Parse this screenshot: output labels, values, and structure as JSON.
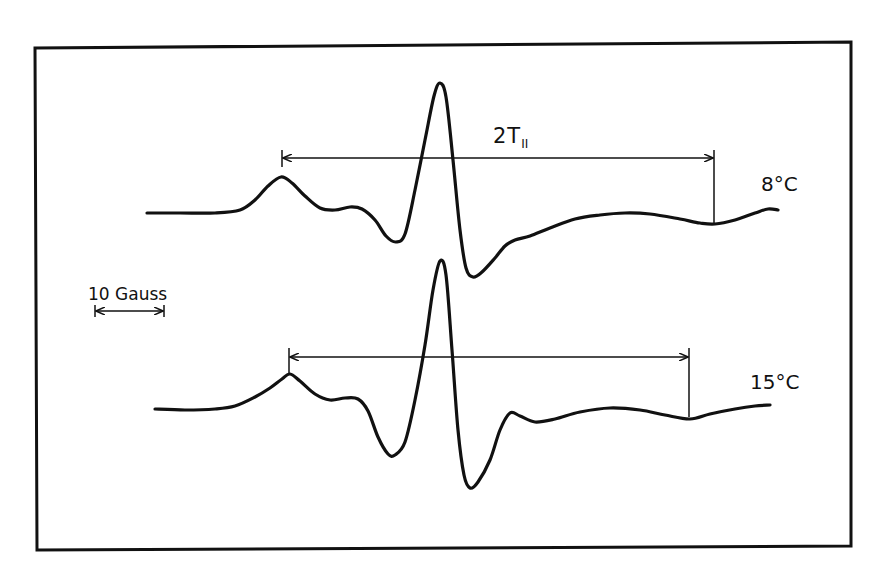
{
  "figure": {
    "type": "EPR spectra comparison",
    "frame_color": "#111111",
    "trace_color": "#111111",
    "background": "#ffffff"
  },
  "labels": {
    "splitting_main": "2T",
    "splitting_sub": "II",
    "trace_top_temp": "8°C",
    "trace_bottom_temp": "15°C",
    "scale_bar": "10 Gauss"
  },
  "spectra": [
    {
      "name": "8°C",
      "bracket": {
        "x_start": 282,
        "x_end": 714,
        "y": 158,
        "label": "2T||"
      },
      "points": [
        [
          147,
          213
        ],
        [
          180,
          213
        ],
        [
          215,
          213
        ],
        [
          240,
          210
        ],
        [
          255,
          200
        ],
        [
          268,
          186
        ],
        [
          281,
          177
        ],
        [
          292,
          183
        ],
        [
          305,
          196
        ],
        [
          320,
          208
        ],
        [
          335,
          210
        ],
        [
          350,
          207
        ],
        [
          362,
          209
        ],
        [
          375,
          220
        ],
        [
          386,
          236
        ],
        [
          396,
          242
        ],
        [
          405,
          234
        ],
        [
          415,
          190
        ],
        [
          425,
          140
        ],
        [
          434,
          96
        ],
        [
          440,
          83
        ],
        [
          446,
          97
        ],
        [
          453,
          160
        ],
        [
          460,
          230
        ],
        [
          466,
          268
        ],
        [
          473,
          277
        ],
        [
          482,
          272
        ],
        [
          495,
          258
        ],
        [
          505,
          246
        ],
        [
          515,
          240
        ],
        [
          530,
          236
        ],
        [
          550,
          228
        ],
        [
          575,
          219
        ],
        [
          600,
          215
        ],
        [
          625,
          213
        ],
        [
          650,
          214
        ],
        [
          680,
          219
        ],
        [
          700,
          223
        ],
        [
          715,
          224
        ],
        [
          735,
          220
        ],
        [
          755,
          213
        ],
        [
          768,
          209
        ],
        [
          778,
          210
        ]
      ]
    },
    {
      "name": "15°C",
      "bracket": {
        "x_start": 289,
        "x_end": 689,
        "y": 357
      },
      "points": [
        [
          155,
          409
        ],
        [
          185,
          410
        ],
        [
          215,
          409
        ],
        [
          235,
          406
        ],
        [
          255,
          397
        ],
        [
          270,
          388
        ],
        [
          282,
          379
        ],
        [
          290,
          374
        ],
        [
          300,
          381
        ],
        [
          315,
          394
        ],
        [
          330,
          400
        ],
        [
          345,
          398
        ],
        [
          358,
          399
        ],
        [
          368,
          411
        ],
        [
          378,
          437
        ],
        [
          388,
          454
        ],
        [
          395,
          455
        ],
        [
          405,
          442
        ],
        [
          415,
          400
        ],
        [
          425,
          345
        ],
        [
          433,
          290
        ],
        [
          440,
          261
        ],
        [
          446,
          275
        ],
        [
          452,
          350
        ],
        [
          458,
          430
        ],
        [
          464,
          475
        ],
        [
          470,
          488
        ],
        [
          478,
          482
        ],
        [
          490,
          460
        ],
        [
          500,
          430
        ],
        [
          510,
          413
        ],
        [
          520,
          416
        ],
        [
          535,
          422
        ],
        [
          555,
          419
        ],
        [
          580,
          412
        ],
        [
          610,
          408
        ],
        [
          640,
          410
        ],
        [
          665,
          415
        ],
        [
          690,
          419
        ],
        [
          710,
          414
        ],
        [
          735,
          409
        ],
        [
          755,
          406
        ],
        [
          770,
          405
        ]
      ]
    }
  ],
  "scale_bar": {
    "x_start": 95,
    "x_end": 164,
    "y": 311,
    "value": 10,
    "unit": "Gauss"
  }
}
